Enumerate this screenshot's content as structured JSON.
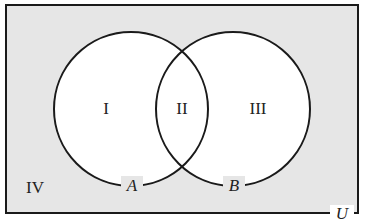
{
  "diagram": {
    "type": "venn",
    "universe_label": "U",
    "sets": [
      {
        "name": "A",
        "cx": 131,
        "cy": 109,
        "r": 77
      },
      {
        "name": "B",
        "cx": 233,
        "cy": 109,
        "r": 77
      }
    ],
    "regions": [
      {
        "id": "I",
        "label": "I",
        "x": 106,
        "y": 114
      },
      {
        "id": "II",
        "label": "II",
        "x": 182,
        "y": 114
      },
      {
        "id": "III",
        "label": "III",
        "x": 258,
        "y": 114
      },
      {
        "id": "IV",
        "label": "IV",
        "x": 38,
        "y": 193
      }
    ],
    "colors": {
      "background": "#e6e6e6",
      "circle_fill": "#ffffff",
      "stroke": "#1a1a1a"
    }
  }
}
